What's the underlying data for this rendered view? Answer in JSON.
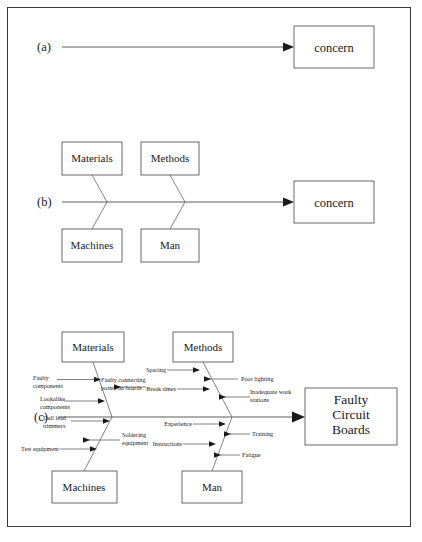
{
  "figure": {
    "panels": [
      {
        "id": "a",
        "label": "(a)",
        "effect_box": "concern",
        "description": "Spine arrow pointing to effect box"
      },
      {
        "id": "b",
        "label": "(b)",
        "effect_box": "concern",
        "categories": [
          "Materials",
          "Methods",
          "Machines",
          "Man"
        ],
        "description": "Spine with four main category bones"
      },
      {
        "id": "c",
        "label": "(c)",
        "effect_box": "Faulty Circuit Boards",
        "effect_box_lines": [
          "Faulty",
          "Circuit",
          "Boards"
        ],
        "categories": [
          "Materials",
          "Methods",
          "Machines",
          "Man"
        ],
        "description": "Completed fishbone with sub-causes"
      }
    ]
  },
  "panel_a": {
    "label": "(a)",
    "effect": "concern"
  },
  "panel_b": {
    "label": "(b)",
    "effect": "concern",
    "boxes": {
      "top_left": "Materials",
      "top_right": "Methods",
      "bottom_left": "Machines",
      "bottom_right": "Man"
    }
  },
  "panel_c": {
    "label": "(c)",
    "effect_line1": "Faulty",
    "effect_line2": "Circuit",
    "effect_line3": "Boards",
    "boxes": {
      "top_left": "Materials",
      "top_right": "Methods",
      "bottom_left": "Machines",
      "bottom_right": "Man"
    },
    "causes": {
      "materials": [
        {
          "id": "faulty-components",
          "line1": "Faulty",
          "line2": "components",
          "side": "left"
        },
        {
          "id": "faulty-connecting-points",
          "line1": "Faulty connecting",
          "line2": "points on boards",
          "side": "right"
        },
        {
          "id": "lookalike-components",
          "line1": "Lookalike",
          "line2": "components",
          "side": "left"
        }
      ],
      "machines": [
        {
          "id": "dull-lead-trimmers",
          "line1": "Dull lead",
          "line2": "trimmers",
          "side": "left"
        },
        {
          "id": "soldering-equipment",
          "line1": "Soldering",
          "line2": "equipment",
          "side": "right"
        },
        {
          "id": "test-equipment",
          "line1": "Test equipment",
          "line2": "",
          "side": "left"
        }
      ],
      "methods": [
        {
          "id": "spacing",
          "line1": "Spacing",
          "line2": "",
          "side": "left"
        },
        {
          "id": "poor-lighting",
          "line1": "Poor lighting",
          "line2": "",
          "side": "right"
        },
        {
          "id": "break-times",
          "line1": "Break times",
          "line2": "",
          "side": "left"
        },
        {
          "id": "inadequate-work-stations",
          "line1": "Inadequate work",
          "line2": "stations",
          "side": "right"
        }
      ],
      "man": [
        {
          "id": "experience",
          "line1": "Experience",
          "line2": "",
          "side": "left"
        },
        {
          "id": "training",
          "line1": "Training",
          "line2": "",
          "side": "right"
        },
        {
          "id": "instructions",
          "line1": "Instructions",
          "line2": "",
          "side": "left"
        },
        {
          "id": "fatigue",
          "line1": "Fatigue",
          "line2": "",
          "side": "right"
        }
      ]
    }
  },
  "colors": {
    "ink": "#1a1a1a",
    "line": "#4a4a4a",
    "border": "#3a3a3a",
    "paper": "#ffffff"
  }
}
